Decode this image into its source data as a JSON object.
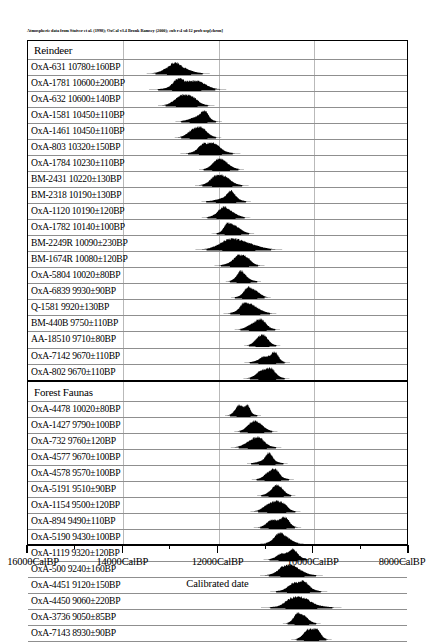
{
  "credit": "Atmospheric data from Stuiver et al. (1998); OxCal v3.4 Bronk Ramsey (2000); cub r:4 sd:12 prob usp[chron]",
  "axis": {
    "title": "Calibrated date",
    "ticks": [
      {
        "label": "16000CalBP",
        "value": 16000
      },
      {
        "label": "14000CalBP",
        "value": 14000
      },
      {
        "label": "12000CalBP",
        "value": 12000
      },
      {
        "label": "10000CalBP",
        "value": 10000
      },
      {
        "label": "8000CalBP",
        "value": 8000
      }
    ],
    "min": 8000,
    "max": 16000,
    "reversed": true,
    "minor_interval": 1000
  },
  "chart_data": {
    "type": "area",
    "title": "",
    "xlabel": "Calibrated date",
    "ylabel": "",
    "xlim": [
      16000,
      8000
    ],
    "grid": true,
    "legend": "none",
    "groups": [
      {
        "name": "Reindeer",
        "samples": [
          {
            "label": "OxA-631  10780±160BP",
            "lab": "OxA-631",
            "bp": 10780,
            "err": 160
          },
          {
            "label": "OxA-1781  10600±200BP",
            "lab": "OxA-1781",
            "bp": 10600,
            "err": 200
          },
          {
            "label": "OxA-632  10600±140BP",
            "lab": "OxA-632",
            "bp": 10600,
            "err": 140
          },
          {
            "label": "OxA-1581  10450±110BP",
            "lab": "OxA-1581",
            "bp": 10450,
            "err": 110
          },
          {
            "label": "OxA-1461  10450±110BP",
            "lab": "OxA-1461",
            "bp": 10450,
            "err": 110
          },
          {
            "label": "OxA-803  10320±150BP",
            "lab": "OxA-803",
            "bp": 10320,
            "err": 150
          },
          {
            "label": "OxA-1784  10230±110BP",
            "lab": "OxA-1784",
            "bp": 10230,
            "err": 110
          },
          {
            "label": "BM-2431  10220±130BP",
            "lab": "BM-2431",
            "bp": 10220,
            "err": 130
          },
          {
            "label": "BM-2318  10190±130BP",
            "lab": "BM-2318",
            "bp": 10190,
            "err": 130
          },
          {
            "label": "OxA-1120  10190±120BP",
            "lab": "OxA-1120",
            "bp": 10190,
            "err": 120
          },
          {
            "label": "OxA-1782  10140±100BP",
            "lab": "OxA-1782",
            "bp": 10140,
            "err": 100
          },
          {
            "label": "BM-2249R  10090±230BP",
            "lab": "BM-2249R",
            "bp": 10090,
            "err": 230
          },
          {
            "label": "BM-1674R  10080±120BP",
            "lab": "BM-1674R",
            "bp": 10080,
            "err": 120
          },
          {
            "label": "OxA-5804  10020±80BP",
            "lab": "OxA-5804",
            "bp": 10020,
            "err": 80
          },
          {
            "label": "OxA-6839  9930±90BP",
            "lab": "OxA-6839",
            "bp": 9930,
            "err": 90
          },
          {
            "label": "Q-1581  9920±130BP",
            "lab": "Q-1581",
            "bp": 9920,
            "err": 130
          },
          {
            "label": "BM-440B  9750±110BP",
            "lab": "BM-440B",
            "bp": 9750,
            "err": 110
          },
          {
            "label": "AA-18510  9710±80BP",
            "lab": "AA-18510",
            "bp": 9710,
            "err": 80
          },
          {
            "label": "OxA-7142  9670±110BP",
            "lab": "OxA-7142",
            "bp": 9670,
            "err": 110
          },
          {
            "label": "OxA-802  9670±110BP",
            "lab": "OxA-802",
            "bp": 9670,
            "err": 110
          }
        ]
      },
      {
        "name": "Forest Faunas",
        "samples": [
          {
            "label": "OxA-4478  10020±80BP",
            "lab": "OxA-4478",
            "bp": 10020,
            "err": 80
          },
          {
            "label": "OxA-1427  9790±100BP",
            "lab": "OxA-1427",
            "bp": 9790,
            "err": 100
          },
          {
            "label": "OxA-732  9760±120BP",
            "lab": "OxA-732",
            "bp": 9760,
            "err": 120
          },
          {
            "label": "OxA-4577  9670±100BP",
            "lab": "OxA-4577",
            "bp": 9670,
            "err": 100
          },
          {
            "label": "OxA-4578  9570±100BP",
            "lab": "OxA-4578",
            "bp": 9570,
            "err": 100
          },
          {
            "label": "OxA-5191  9510±90BP",
            "lab": "OxA-5191",
            "bp": 9510,
            "err": 90
          },
          {
            "label": "OxA-1154  9500±120BP",
            "lab": "OxA-1154",
            "bp": 9500,
            "err": 120
          },
          {
            "label": "OxA-894  9490±110BP",
            "lab": "OxA-894",
            "bp": 9490,
            "err": 110
          },
          {
            "label": "OxA-5190  9430±100BP",
            "lab": "OxA-5190",
            "bp": 9430,
            "err": 100
          },
          {
            "label": "OxA-1119  9320±120BP",
            "lab": "OxA-1119",
            "bp": 9320,
            "err": 120
          },
          {
            "label": "OxA-500  9240±160BP",
            "lab": "OxA-500",
            "bp": 9240,
            "err": 160
          },
          {
            "label": "OxA-4451  9120±150BP",
            "lab": "OxA-4451",
            "bp": 9120,
            "err": 150
          },
          {
            "label": "OxA-4450  9060±220BP",
            "lab": "OxA-4450",
            "bp": 9060,
            "err": 220
          },
          {
            "label": "OxA-3736  9050±85BP",
            "lab": "OxA-3736",
            "bp": 9050,
            "err": 85
          },
          {
            "label": "OxA-7143  8930±90BP",
            "lab": "OxA-7143",
            "bp": 8930,
            "err": 90
          }
        ]
      }
    ]
  }
}
